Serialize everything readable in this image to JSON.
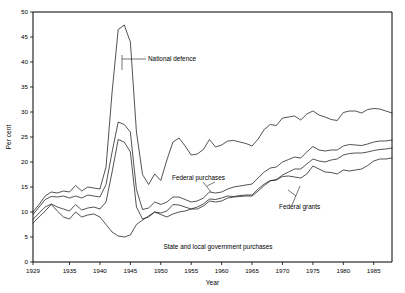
{
  "figure": {
    "background_color": "#ffffff",
    "line_color": "#1a1a1a",
    "width": 405,
    "height": 293
  },
  "axes": {
    "ylabel": "Per cent",
    "xlabel": "Year",
    "ytick_labels": [
      "0",
      "5",
      "10",
      "15",
      "20",
      "25",
      "30",
      "35",
      "40",
      "45",
      "50"
    ],
    "xtick_labels": [
      "1929",
      "1935",
      "1940",
      "1945",
      "1950",
      "1955",
      "1960",
      "1965",
      "1970",
      "1975",
      "1980",
      "1985"
    ]
  },
  "annotations": {
    "national_defence": "National defence",
    "federal_purchases": "Federal purchases",
    "federal_grants": "Federal grants",
    "state_local": "State and local government purchases"
  },
  "chart_data": {
    "type": "line",
    "title": "",
    "xlabel": "Year",
    "ylabel": "Per cent",
    "xlim": [
      1929,
      1988
    ],
    "ylim": [
      0,
      50
    ],
    "ytick_labels": [
      "0",
      "5",
      "10",
      "15",
      "20",
      "25",
      "30",
      "35",
      "40",
      "45",
      "50"
    ],
    "yticks": [
      0,
      5,
      10,
      15,
      20,
      25,
      30,
      35,
      40,
      45,
      50
    ],
    "xticks": [
      1929,
      1935,
      1940,
      1945,
      1950,
      1955,
      1960,
      1965,
      1970,
      1975,
      1980,
      1985
    ],
    "grid": false,
    "legend": "inline-annotations",
    "x": [
      1929,
      1930,
      1931,
      1932,
      1933,
      1934,
      1935,
      1936,
      1937,
      1938,
      1939,
      1940,
      1941,
      1942,
      1943,
      1944,
      1945,
      1946,
      1947,
      1948,
      1949,
      1950,
      1951,
      1952,
      1953,
      1954,
      1955,
      1956,
      1957,
      1958,
      1959,
      1960,
      1961,
      1962,
      1963,
      1964,
      1965,
      1966,
      1967,
      1968,
      1969,
      1970,
      1971,
      1972,
      1973,
      1974,
      1975,
      1976,
      1977,
      1978,
      1979,
      1980,
      1981,
      1982,
      1983,
      1984,
      1985,
      1986,
      1987,
      1988
    ],
    "series": [
      {
        "name": "Total government outlays",
        "label": "National defence",
        "values": [
          10.0,
          11.5,
          13.2,
          14.0,
          13.8,
          14.2,
          14.0,
          15.3,
          14.2,
          15.0,
          14.8,
          14.6,
          19.0,
          34.0,
          46.5,
          47.4,
          44.0,
          26.0,
          17.5,
          15.5,
          17.6,
          16.3,
          20.4,
          24.0,
          24.8,
          23.2,
          21.4,
          21.6,
          22.5,
          24.5,
          23.0,
          23.4,
          24.2,
          24.3,
          24.0,
          23.7,
          23.2,
          24.6,
          26.5,
          27.5,
          27.3,
          28.8,
          29.0,
          29.2,
          28.4,
          29.6,
          30.2,
          29.4,
          29.0,
          28.5,
          28.3,
          29.9,
          30.2,
          30.2,
          29.8,
          30.5,
          30.7,
          30.6,
          30.2,
          29.8
        ]
      },
      {
        "name": "Total purchases plus grants",
        "label": "",
        "values": [
          9.5,
          11.0,
          12.5,
          13.1,
          13.0,
          13.2,
          12.8,
          13.2,
          12.8,
          13.4,
          13.2,
          13.0,
          15.5,
          22.0,
          28.0,
          27.5,
          26.0,
          14.5,
          10.5,
          10.8,
          12.0,
          11.5,
          12.0,
          13.0,
          13.0,
          12.5,
          12.0,
          12.2,
          12.8,
          14.0,
          13.8,
          14.0,
          14.6,
          15.0,
          15.2,
          15.4,
          15.6,
          16.8,
          18.0,
          18.8,
          19.0,
          20.0,
          20.5,
          21.0,
          20.8,
          22.0,
          23.1,
          22.4,
          22.2,
          22.4,
          22.4,
          23.2,
          23.5,
          23.4,
          23.3,
          23.6,
          24.0,
          24.2,
          24.2,
          24.4
        ]
      },
      {
        "name": "Federal purchases",
        "label": "Federal purchases",
        "values": [
          8.5,
          9.8,
          11.0,
          11.6,
          11.0,
          10.6,
          10.2,
          11.5,
          10.4,
          10.8,
          11.0,
          10.6,
          12.0,
          18.0,
          24.5,
          24.0,
          22.0,
          11.0,
          8.6,
          9.0,
          10.0,
          9.8,
          10.2,
          11.5,
          11.4,
          11.0,
          10.6,
          10.6,
          11.2,
          12.2,
          12.0,
          12.2,
          12.8,
          13.0,
          13.1,
          13.2,
          13.2,
          14.2,
          15.3,
          16.2,
          16.5,
          17.4,
          18.0,
          18.6,
          18.6,
          19.6,
          20.6,
          20.2,
          20.0,
          20.4,
          20.6,
          21.4,
          21.7,
          21.8,
          21.8,
          22.0,
          22.3,
          22.5,
          22.6,
          22.8
        ]
      },
      {
        "name": "State and local government purchases",
        "label": "Federal grants",
        "values": [
          7.8,
          9.0,
          10.2,
          11.5,
          10.2,
          9.0,
          8.6,
          10.0,
          9.0,
          9.4,
          9.6,
          9.0,
          7.5,
          6.0,
          5.2,
          5.0,
          5.4,
          7.5,
          8.4,
          9.2,
          10.0,
          9.5,
          9.0,
          9.6,
          10.0,
          10.2,
          10.6,
          11.0,
          11.6,
          12.6,
          12.5,
          12.8,
          13.2,
          13.1,
          13.3,
          13.4,
          13.4,
          14.6,
          15.6,
          16.3,
          16.4,
          17.1,
          17.2,
          17.0,
          16.8,
          17.6,
          19.2,
          18.6,
          18.0,
          17.9,
          17.6,
          18.4,
          18.2,
          18.4,
          18.6,
          19.3,
          20.2,
          20.6,
          20.6,
          20.8
        ]
      }
    ]
  }
}
